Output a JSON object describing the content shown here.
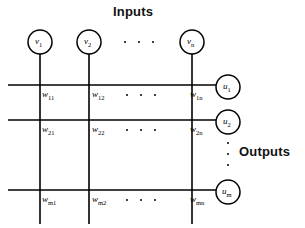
{
  "figure": {
    "title_inputs": "Inputs",
    "title_outputs": "Outputs",
    "background": "#ffffff",
    "stroke": "#000000"
  },
  "inputs": {
    "label": "Inputs",
    "nodes": [
      {
        "symbol": "v",
        "sub": "1",
        "cx": 40,
        "cy": 42,
        "r": 12
      },
      {
        "symbol": "v",
        "sub": "2",
        "cx": 89,
        "cy": 42,
        "r": 12
      },
      {
        "symbol": "v",
        "sub": "n",
        "cx": 192,
        "cy": 42,
        "r": 12
      }
    ],
    "ellipsis_dots": 3
  },
  "outputs": {
    "label": "Outputs",
    "nodes": [
      {
        "symbol": "u",
        "sub": "1",
        "cx": 228,
        "cy": 87,
        "r": 12
      },
      {
        "symbol": "u",
        "sub": "2",
        "cx": 228,
        "cy": 122,
        "r": 12
      },
      {
        "symbol": "u",
        "sub": "m",
        "cx": 228,
        "cy": 192,
        "r": 12
      }
    ],
    "ellipsis_dots": 3
  },
  "weights": {
    "rows": [
      {
        "row_index": "1",
        "cells": [
          {
            "symbol": "w",
            "sub": "11",
            "x": 42,
            "y": 90
          },
          {
            "symbol": "w",
            "sub": "12",
            "x": 92,
            "y": 90
          },
          {
            "symbol": "w",
            "sub": "1n",
            "x": 190,
            "y": 90
          }
        ],
        "ellipsis_dots": 3
      },
      {
        "row_index": "2",
        "cells": [
          {
            "symbol": "w",
            "sub": "21",
            "x": 42,
            "y": 125
          },
          {
            "symbol": "w",
            "sub": "22",
            "x": 92,
            "y": 125
          },
          {
            "symbol": "w",
            "sub": "2n",
            "x": 190,
            "y": 125
          }
        ],
        "ellipsis_dots": 3
      },
      {
        "row_index": "m",
        "cells": [
          {
            "symbol": "w",
            "sub": "m1",
            "x": 42,
            "y": 195
          },
          {
            "symbol": "w",
            "sub": "m2",
            "x": 92,
            "y": 195
          },
          {
            "symbol": "w",
            "sub": "mn",
            "x": 190,
            "y": 195
          }
        ],
        "ellipsis_dots": 3
      }
    ]
  },
  "grid": {
    "vertical_lines_x": [
      40,
      89,
      192
    ],
    "vertical_line_top": 54,
    "vertical_line_bottom": 224,
    "horizontal_lines_y": [
      85,
      120,
      190
    ],
    "horizontal_line_left": 8,
    "horizontal_line_right": 216
  }
}
